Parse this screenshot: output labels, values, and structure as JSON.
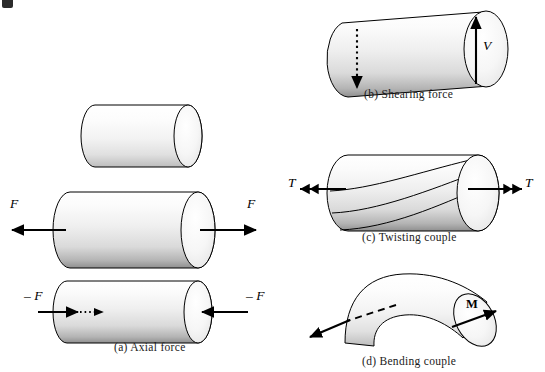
{
  "figure": {
    "background_color": "#ffffff",
    "line_color": "#000000",
    "shade_light": "#fdfdfd",
    "shade_mid": "#e8e8e8",
    "shade_dark": "#9a9a9a"
  },
  "panels": {
    "a": {
      "caption": "(a)  Axial force",
      "unloaded": {
        "name": "unloaded-bar"
      },
      "tension": {
        "left_label": "F",
        "right_label": "F",
        "arrow_direction_left": "left",
        "arrow_direction_right": "right"
      },
      "compression": {
        "left_label": "– F",
        "right_label": "– F",
        "arrow_direction_left": "right",
        "arrow_direction_right": "left",
        "interior_marker": "dotted-arrow"
      }
    },
    "b": {
      "caption": "(b)  Shearing force",
      "label": "V",
      "front_arrow_direction": "up",
      "hidden_arrow_direction": "down",
      "hidden_arrow_style": "dotted"
    },
    "c": {
      "caption": "(c)  Twisting couple",
      "left_label": "T",
      "right_label": "T",
      "arrow_style": "double-headed",
      "helix_line_count": 3
    },
    "d": {
      "caption": "(d)  Bending couple",
      "label": "M",
      "right_arrow_style": "solid-diagonal",
      "left_arrow_style": "dashed-to-solid"
    }
  }
}
